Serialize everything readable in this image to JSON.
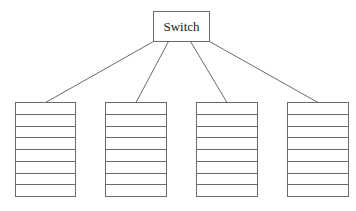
{
  "diagram": {
    "switch": {
      "label": "Switch",
      "x": 153,
      "y": 11,
      "w": 56,
      "h": 30
    },
    "servers": [
      {
        "name": "server-1",
        "x": 15,
        "y": 102,
        "w": 60,
        "h": 94,
        "rows": 8,
        "link_from_x": 153
      },
      {
        "name": "server-2",
        "x": 105,
        "y": 102,
        "w": 61,
        "h": 94,
        "rows": 8,
        "link_from_x": 168
      },
      {
        "name": "server-3",
        "x": 196,
        "y": 102,
        "w": 61,
        "h": 94,
        "rows": 8,
        "link_from_x": 190
      },
      {
        "name": "server-4",
        "x": 287,
        "y": 102,
        "w": 61,
        "h": 94,
        "rows": 8,
        "link_from_x": 209
      }
    ],
    "stroke_color": "#6a6a6a"
  }
}
